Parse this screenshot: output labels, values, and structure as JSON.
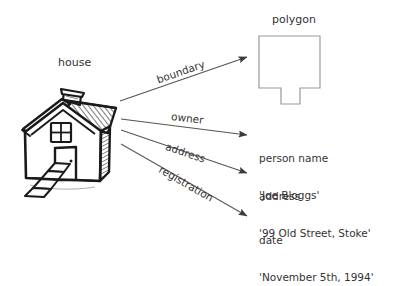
{
  "diagram": {
    "title_nodes": {
      "house_label": "house",
      "polygon_label": "polygon"
    },
    "colors": {
      "sketch_stroke": "#1a1a1a",
      "arrow_stroke": "#555555",
      "shape_stroke": "#999999",
      "text": "#333333",
      "background": "#ffffff"
    },
    "edges": [
      {
        "label": "boundary"
      },
      {
        "label": "owner"
      },
      {
        "label": "address"
      },
      {
        "label": "registration"
      }
    ],
    "targets": [
      {
        "kind": "shape",
        "name": "polygon",
        "label": "polygon"
      },
      {
        "kind": "value",
        "name": "person-name",
        "line1": "person name",
        "line2": "'Joe Bloggs'"
      },
      {
        "kind": "value",
        "name": "address",
        "line1": "address",
        "line2": "'99 Old Street, Stoke'"
      },
      {
        "kind": "value",
        "name": "date",
        "line1": "date",
        "line2": "'November 5th, 1994'"
      }
    ]
  }
}
